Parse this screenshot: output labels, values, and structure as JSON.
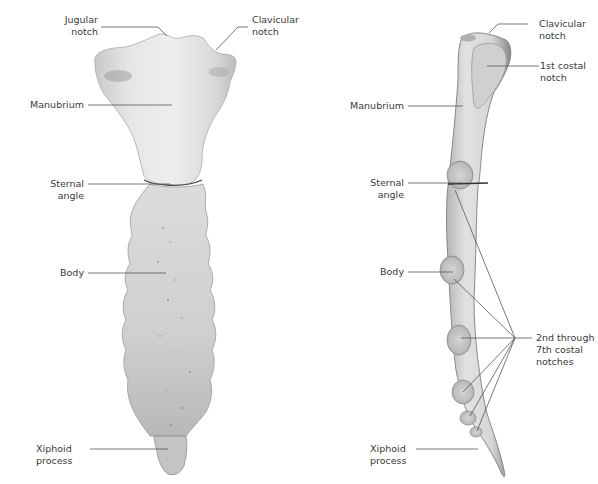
{
  "figure": {
    "views": [
      {
        "name": "anterior-view",
        "labels": {
          "jugular_notch": "Jugular\nnotch",
          "clavicular_notch": "Clavicular\nnotch",
          "manubrium": "Manubrium",
          "sternal_angle": "Sternal\nangle",
          "body": "Body",
          "xiphoid_process": "Xiphoid\nprocess"
        }
      },
      {
        "name": "lateral-view",
        "labels": {
          "clavicular_notch": "Clavicular\nnotch",
          "first_costal_notch": "1st costal\nnotch",
          "manubrium": "Manubrium",
          "sternal_angle": "Sternal\nangle",
          "body": "Body",
          "costal_notches": "2nd through\n7th costal\nnotches",
          "xiphoid_process": "Xiphoid\nprocess"
        }
      }
    ],
    "colors": {
      "bone_light": "#ececec",
      "bone_mid": "#cfcfcf",
      "bone_dark": "#8f8f8f",
      "leader_line": "#555555",
      "label_text": "#3a3a3a"
    }
  }
}
